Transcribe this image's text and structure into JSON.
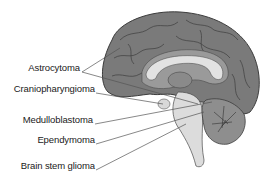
{
  "diagram": {
    "type": "anatomical-labeled",
    "colors": {
      "cortex": "#7a7a7a",
      "cortex_outline": "#3c3c3c",
      "white_matter": "#d2d2d2",
      "corpus_callosum": "#e2e2e2",
      "brainstem": "#dcdcdc",
      "cerebellum": "#8e8e8e",
      "leader_line": "#555555",
      "label_text": "#1a1a1a"
    },
    "labels": [
      {
        "id": "astrocytoma",
        "text": "Astrocytoma",
        "x": 80,
        "y": 67
      },
      {
        "id": "craniopharyngioma",
        "text": "Craniopharyngioma",
        "x": 95,
        "y": 88
      },
      {
        "id": "medulloblastoma",
        "text": "Medulloblastoma",
        "x": 93,
        "y": 119
      },
      {
        "id": "ependymoma",
        "text": "Ependymoma",
        "x": 95,
        "y": 139
      },
      {
        "id": "brain-stem-glioma",
        "text": "Brain stem glioma",
        "x": 95,
        "y": 165
      }
    ]
  }
}
